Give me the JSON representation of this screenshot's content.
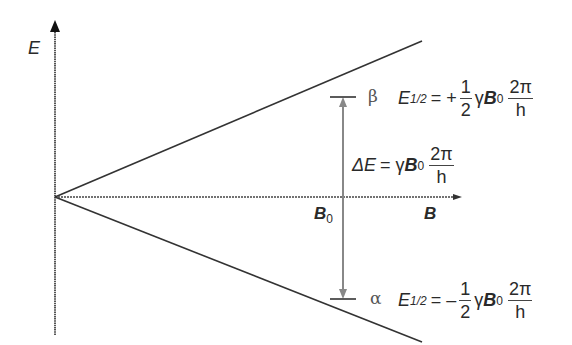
{
  "diagram": {
    "type": "energy-level-diagram",
    "axes": {
      "y_label": "E",
      "x_label": "B",
      "x_marker_label": "B",
      "x_marker_sub": "0"
    },
    "levels": {
      "beta": {
        "symbol": "β",
        "lhs": "E",
        "lhs_sub": "1/2",
        "sign": "= +",
        "frac_num": "1",
        "frac_den": "2",
        "gamma": "γ",
        "b": "B",
        "b_sub": "0",
        "frac2_num": "2π",
        "frac2_den": "h"
      },
      "alpha": {
        "symbol": "α",
        "lhs": "E",
        "lhs_sub": "1/2",
        "sign": "= –",
        "frac_num": "1",
        "frac_den": "2",
        "gamma": "γ",
        "b": "B",
        "b_sub": "0",
        "frac2_num": "2π",
        "frac2_den": "h"
      }
    },
    "delta": {
      "lhs": "ΔE",
      "eq": "= γ",
      "b": "B",
      "b_sub": "0",
      "frac_num": "2π",
      "frac_den": "h"
    },
    "colors": {
      "axis": "#333333",
      "line": "#333333",
      "arrow": "#888888"
    }
  }
}
